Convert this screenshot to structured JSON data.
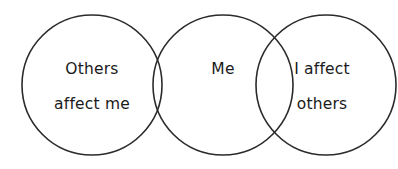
{
  "diagram": {
    "type": "venn-three-overlapping-circles",
    "background_color": "#ffffff",
    "stroke_color": "#2b2b2b",
    "text_color": "#1a1a1a",
    "circles": [
      {
        "id": "left",
        "label_lines": [
          "Others",
          "affect me"
        ],
        "cx": 92,
        "cy": 85,
        "r": 70
      },
      {
        "id": "center",
        "label_lines": [
          "Me"
        ],
        "cx": 223,
        "cy": 85,
        "r": 70
      },
      {
        "id": "right",
        "label_lines": [
          "I affect",
          "others"
        ],
        "cx": 326,
        "cy": 85,
        "r": 70
      }
    ],
    "labels": {
      "left": {
        "line1": "Others",
        "line2": "affect me"
      },
      "center": {
        "line1": "Me",
        "line2": ""
      },
      "right": {
        "line1": "I affect",
        "line2": "others"
      }
    }
  }
}
